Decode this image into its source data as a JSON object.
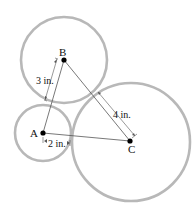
{
  "diagram": {
    "points": {
      "A": {
        "label": "A",
        "cx": 43,
        "cy": 133
      },
      "B": {
        "label": "B",
        "cx": 64,
        "cy": 60
      },
      "C": {
        "label": "C",
        "cx": 130,
        "cy": 141
      }
    },
    "circles": {
      "A": {
        "cx": 43,
        "cy": 133,
        "r": 28
      },
      "B": {
        "cx": 64,
        "cy": 60,
        "r": 43
      },
      "C": {
        "cx": 131,
        "cy": 142,
        "r": 59
      }
    },
    "dimensions": {
      "AB": "3 in.",
      "AC": "2 in.",
      "BC": "4 in."
    },
    "colors": {
      "circle_stroke": "#b8b8b8",
      "line": "#555555",
      "dot": "#000000"
    }
  }
}
